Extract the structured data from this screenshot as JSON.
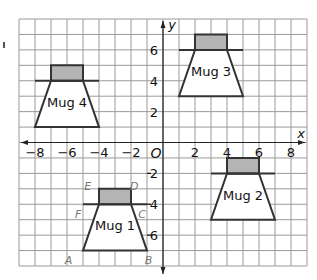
{
  "chart_data": {
    "type": "scatter",
    "title": "",
    "xlabel": "x",
    "ylabel": "y",
    "origin_label": "O",
    "xlim": [
      -9,
      9
    ],
    "ylim": [
      -8,
      8
    ],
    "grid": true,
    "x_ticks": [
      -8,
      -6,
      -4,
      -2,
      2,
      4,
      6,
      8
    ],
    "y_ticks": [
      6,
      4,
      2,
      -2,
      -4,
      -6
    ],
    "x_tick_labels": [
      "−8",
      "−6",
      "−4",
      "−2",
      "2",
      "4",
      "6",
      "8"
    ],
    "y_tick_labels": [
      "6",
      "4",
      "2",
      "2",
      "4",
      "6"
    ],
    "mugs": [
      {
        "name": "Mug 1",
        "lid": [
          [
            -4,
            -3
          ],
          [
            -2,
            -3
          ],
          [
            -2,
            -4
          ],
          [
            -4,
            -4
          ]
        ],
        "handle": [
          [
            -5,
            -4
          ],
          [
            -1,
            -4
          ]
        ],
        "body": [
          [
            -4,
            -4
          ],
          [
            -2,
            -4
          ],
          [
            -1,
            -7
          ],
          [
            -5,
            -7
          ]
        ],
        "label_at": [
          -3,
          -5.7
        ],
        "vertices": [
          {
            "label": "A",
            "x": -5.9,
            "y": -7.6
          },
          {
            "label": "B",
            "x": -0.9,
            "y": -7.6
          },
          {
            "label": "C",
            "x": -1.3,
            "y": -4.6
          },
          {
            "label": "D",
            "x": -1.8,
            "y": -2.8
          },
          {
            "label": "E",
            "x": -4.7,
            "y": -2.8
          },
          {
            "label": "F",
            "x": -5.3,
            "y": -4.6
          }
        ]
      },
      {
        "name": "Mug 2",
        "lid": [
          [
            4,
            -1
          ],
          [
            6,
            -1
          ],
          [
            6,
            -2
          ],
          [
            4,
            -2
          ]
        ],
        "handle": [
          [
            3,
            -2
          ],
          [
            7,
            -2
          ]
        ],
        "body": [
          [
            4,
            -2
          ],
          [
            6,
            -2
          ],
          [
            7,
            -5
          ],
          [
            3,
            -5
          ]
        ],
        "label_at": [
          5,
          -3.7
        ],
        "vertices": []
      },
      {
        "name": "Mug 3",
        "lid": [
          [
            2,
            7
          ],
          [
            4,
            7
          ],
          [
            4,
            6
          ],
          [
            2,
            6
          ]
        ],
        "handle": [
          [
            1,
            6
          ],
          [
            5,
            6
          ]
        ],
        "body": [
          [
            2,
            6
          ],
          [
            4,
            6
          ],
          [
            5,
            3
          ],
          [
            1,
            3
          ]
        ],
        "label_at": [
          3,
          4.3
        ],
        "vertices": []
      },
      {
        "name": "Mug 4",
        "lid": [
          [
            -7,
            5
          ],
          [
            -5,
            5
          ],
          [
            -5,
            4
          ],
          [
            -7,
            4
          ]
        ],
        "handle": [
          [
            -8,
            4
          ],
          [
            -4,
            4
          ]
        ],
        "body": [
          [
            -7,
            4
          ],
          [
            -5,
            4
          ],
          [
            -4,
            1
          ],
          [
            -8,
            1
          ]
        ],
        "label_at": [
          -6,
          2.3
        ],
        "vertices": []
      }
    ]
  }
}
